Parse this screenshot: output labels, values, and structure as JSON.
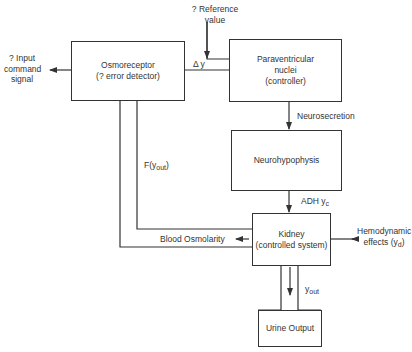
{
  "diagram": {
    "type": "feedback control block diagram",
    "blocks": {
      "osmoreceptor": {
        "line1": "Osmoreceptor",
        "line2": "(? error detector)"
      },
      "paraventricular": {
        "line1": "Paraventricular",
        "line2": "nuclei",
        "line3": "(controller)"
      },
      "neurohypophysis": {
        "line1": "Neurohypophysis"
      },
      "kidney": {
        "line1": "Kidney",
        "line2": "(controlled system)"
      },
      "urine_output": {
        "line1": "Urine Output"
      }
    },
    "labels": {
      "input_command": {
        "line1": "? Input",
        "line2": "command",
        "line3": "signal"
      },
      "reference_value": {
        "line1": "? Reference",
        "line2": "value"
      },
      "delta_y": "Δ y",
      "neurosecretion": "Neurosecretion",
      "adh": {
        "text": "ADH y",
        "sub": "c"
      },
      "f_yout": {
        "text": "F(y",
        "sub": "out",
        "tail": ")"
      },
      "blood_osmolarity": "Blood Osmolarity",
      "hemodynamic": {
        "line1": "Hemodynamic",
        "line2": "effects (y",
        "sub": "d",
        "tail": ")"
      },
      "yout": {
        "text": "y",
        "sub": "out"
      }
    },
    "colors": {
      "line": "#333333",
      "background": "#ffffff"
    }
  }
}
